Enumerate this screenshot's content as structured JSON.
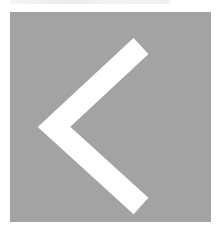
{
  "button": {
    "icon": "chevron-left-icon",
    "action": "back",
    "background_color": "#a3a3a3",
    "icon_color": "#ffffff"
  }
}
